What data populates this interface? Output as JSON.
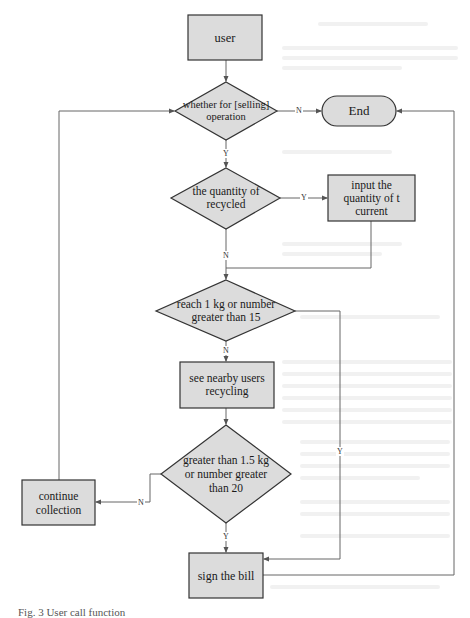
{
  "diagram": {
    "type": "flowchart",
    "colors": {
      "node_fill": "#dcdcdc",
      "node_stroke": "#333333",
      "edge": "#555555"
    },
    "nodes": {
      "user": {
        "label": "user",
        "shape": "rectangle"
      },
      "decision_selling": {
        "label": "whether for [selling] operation",
        "shape": "diamond"
      },
      "end": {
        "label": "End",
        "shape": "terminator"
      },
      "decision_quantity": {
        "label": "the quantity of recycled",
        "shape": "diamond"
      },
      "input_quantity": {
        "label": "input the quantity of t current",
        "shape": "rectangle"
      },
      "decision_1kg": {
        "label": "reach 1 kg or number greater than 15",
        "shape": "diamond"
      },
      "see_nearby": {
        "label": "see nearby users recycling",
        "shape": "rectangle"
      },
      "decision_15kg": {
        "label": "greater than 1.5 kg or number greater than 20",
        "shape": "diamond"
      },
      "continue_collection": {
        "label": "continue collection",
        "shape": "rectangle"
      },
      "sign_bill": {
        "label": "sign the bill",
        "shape": "rectangle"
      }
    },
    "edge_labels": {
      "selling_no": "N",
      "selling_yes": "Y",
      "quantity_yes": "Y",
      "quantity_no": "N",
      "kg1_no": "N",
      "kg1_yes": "Y",
      "kg15_no": "N",
      "kg15_yes": "Y"
    },
    "edges": [
      {
        "from": "user",
        "to": "decision_selling"
      },
      {
        "from": "decision_selling",
        "to": "end",
        "label": "N"
      },
      {
        "from": "decision_selling",
        "to": "decision_quantity",
        "label": "Y"
      },
      {
        "from": "decision_quantity",
        "to": "input_quantity",
        "label": "Y"
      },
      {
        "from": "decision_quantity",
        "to": "decision_1kg",
        "label": "N"
      },
      {
        "from": "input_quantity",
        "to": "decision_1kg"
      },
      {
        "from": "decision_1kg",
        "to": "see_nearby",
        "label": "N"
      },
      {
        "from": "decision_1kg",
        "to": "sign_bill",
        "label": "Y"
      },
      {
        "from": "see_nearby",
        "to": "decision_15kg"
      },
      {
        "from": "decision_15kg",
        "to": "continue_collection",
        "label": "N"
      },
      {
        "from": "decision_15kg",
        "to": "sign_bill",
        "label": "Y"
      },
      {
        "from": "continue_collection",
        "to": "decision_selling"
      },
      {
        "from": "sign_bill",
        "to": "end"
      }
    ],
    "caption": "Fig. 3  User call function"
  }
}
